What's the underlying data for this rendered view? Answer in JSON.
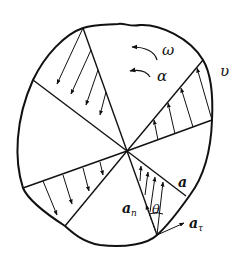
{
  "figure": {
    "colors": {
      "stroke": "#111111",
      "background": "#ffffff"
    }
  },
  "labels": {
    "omega": "ω",
    "alpha": "α",
    "velocity": "υ",
    "acceleration": "a",
    "normal_acceleration": "a",
    "normal_acceleration_sub": "n",
    "tangential_acceleration": "a",
    "tangential_acceleration_sub": "τ",
    "angle": "θ"
  }
}
